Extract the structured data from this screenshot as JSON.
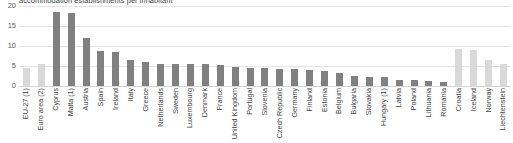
{
  "chart_data": {
    "type": "bar",
    "title": "accommodation establishments per inhabitant",
    "xlabel": "",
    "ylabel": "",
    "ylim": [
      0,
      20
    ],
    "yticks": [
      0,
      5,
      10,
      15,
      20
    ],
    "grid": true,
    "legend": "none",
    "colors": {
      "member": "#808080",
      "aggregate_or_non_eu": "#d9d9d9",
      "gridline": "#e4e4e4",
      "text": "#404040"
    },
    "categories": [
      "EU-27 (1)",
      "Euro area (2)",
      "Cyprus",
      "Malta (1)",
      "Austria",
      "Spain",
      "Ireland",
      "Italy",
      "Greece",
      "Netherlands",
      "Sweden",
      "Luxembourg",
      "Denmark",
      "France",
      "United Kingdom",
      "Portugal",
      "Slovenia",
      "Czech Republic",
      "Germany",
      "Finland",
      "Estonia",
      "Belgium",
      "Bulgaria",
      "Slovakia",
      "Hungary (1)",
      "Latvia",
      "Poland",
      "Lithuania",
      "Romania",
      "Croatia",
      "Iceland",
      "Norway",
      "Liechtenstein"
    ],
    "values": [
      4.6,
      5.5,
      18.6,
      18.2,
      12.0,
      8.8,
      8.5,
      6.4,
      6.0,
      5.5,
      5.4,
      5.4,
      5.4,
      5.3,
      4.8,
      4.6,
      4.4,
      4.3,
      4.2,
      4.0,
      3.8,
      3.2,
      2.6,
      2.3,
      2.2,
      1.5,
      1.4,
      1.2,
      1.1,
      9.2,
      9.0,
      6.4,
      5.4
    ],
    "series_shades": [
      "light",
      "light",
      "dark",
      "dark",
      "dark",
      "dark",
      "dark",
      "dark",
      "dark",
      "dark",
      "dark",
      "dark",
      "dark",
      "dark",
      "dark",
      "dark",
      "dark",
      "dark",
      "dark",
      "dark",
      "dark",
      "dark",
      "dark",
      "dark",
      "dark",
      "dark",
      "dark",
      "dark",
      "dark",
      "light",
      "light",
      "light",
      "light"
    ]
  }
}
